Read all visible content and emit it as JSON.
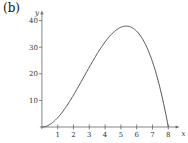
{
  "panel": {
    "label": "(b)"
  },
  "chart_data": {
    "type": "line",
    "title": "",
    "xlabel": "x",
    "ylabel": "y",
    "xlim": [
      0,
      8.4
    ],
    "ylim": [
      0,
      43
    ],
    "xticks": [
      1,
      2,
      3,
      4,
      5,
      6,
      7,
      8
    ],
    "yticks": [
      10,
      20,
      30,
      40
    ],
    "grid": false,
    "legend": null,
    "series": [
      {
        "name": "curve",
        "x": [
          0,
          0.5,
          1,
          1.5,
          2,
          2.5,
          3,
          3.5,
          4,
          4.5,
          5,
          5.33,
          5.5,
          6,
          6.5,
          7,
          7.5,
          8
        ],
        "y": [
          0,
          0.94,
          3.5,
          7.31,
          12,
          17.19,
          22.5,
          27.56,
          32,
          35.44,
          37.5,
          37.93,
          37.81,
          36,
          31.69,
          24.5,
          14.06,
          0
        ]
      }
    ]
  }
}
